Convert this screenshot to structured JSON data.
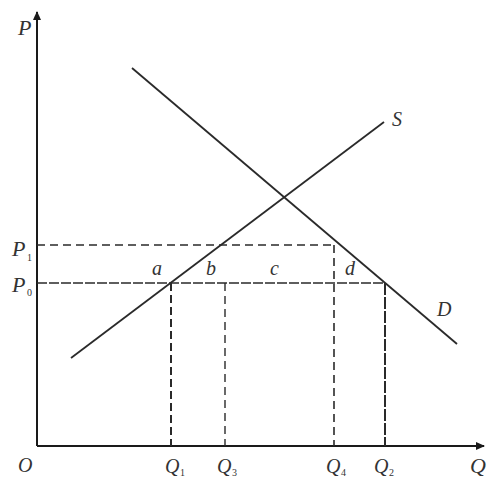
{
  "diagram": {
    "axes": {
      "y_label": "P",
      "x_label": "Q",
      "origin_label": "O"
    },
    "curves": {
      "supply_label": "S",
      "demand_label": "D"
    },
    "price_levels": [
      {
        "label": "P",
        "sub": "1"
      },
      {
        "label": "P",
        "sub": "0"
      }
    ],
    "quantity_levels": [
      {
        "label": "Q",
        "sub": "1"
      },
      {
        "label": "Q",
        "sub": "3"
      },
      {
        "label": "Q",
        "sub": "4"
      },
      {
        "label": "Q",
        "sub": "2"
      }
    ],
    "area_labels": [
      "a",
      "b",
      "c",
      "d"
    ],
    "colors": {
      "line": "#2a2a2a",
      "text": "#333333",
      "background": "#ffffff"
    }
  }
}
